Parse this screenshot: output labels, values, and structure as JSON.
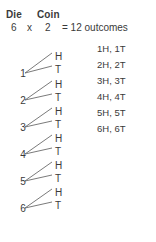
{
  "header": {
    "die_label": "Die",
    "coin_label": "Coin",
    "die_count": "6",
    "times_sign": "x",
    "coin_count": "2",
    "result_text": "= 12 outcomes"
  },
  "colors": {
    "text": "#3a3a3a",
    "line": "#6b6b6b",
    "background": "#ffffff"
  },
  "tree": {
    "die_nodes": [
      {
        "label": "1",
        "x": 18,
        "y": 68
      },
      {
        "label": "2",
        "x": 18,
        "y": 95
      },
      {
        "label": "3",
        "x": 18,
        "y": 122
      },
      {
        "label": "4",
        "x": 18,
        "y": 149
      },
      {
        "label": "5",
        "x": 18,
        "y": 176
      },
      {
        "label": "6",
        "x": 18,
        "y": 203
      }
    ],
    "coin_leaves": [
      {
        "label": "H",
        "x": 55,
        "y": 51
      },
      {
        "label": "T",
        "x": 55,
        "y": 64
      },
      {
        "label": "H",
        "x": 55,
        "y": 79
      },
      {
        "label": "T",
        "x": 55,
        "y": 92
      },
      {
        "label": "H",
        "x": 55,
        "y": 106
      },
      {
        "label": "T",
        "x": 55,
        "y": 119
      },
      {
        "label": "H",
        "x": 55,
        "y": 133
      },
      {
        "label": "T",
        "x": 55,
        "y": 146
      },
      {
        "label": "H",
        "x": 55,
        "y": 160
      },
      {
        "label": "T",
        "x": 55,
        "y": 173
      },
      {
        "label": "H",
        "x": 55,
        "y": 187
      },
      {
        "label": "T",
        "x": 55,
        "y": 200
      }
    ],
    "branches": [
      {
        "x1": 25,
        "y1": 73,
        "x2": 52,
        "y2": 53
      },
      {
        "x1": 25,
        "y1": 73,
        "x2": 52,
        "y2": 66
      },
      {
        "x1": 25,
        "y1": 100,
        "x2": 52,
        "y2": 81
      },
      {
        "x1": 25,
        "y1": 100,
        "x2": 52,
        "y2": 94
      },
      {
        "x1": 25,
        "y1": 127,
        "x2": 52,
        "y2": 108
      },
      {
        "x1": 25,
        "y1": 127,
        "x2": 52,
        "y2": 121
      },
      {
        "x1": 25,
        "y1": 154,
        "x2": 52,
        "y2": 135
      },
      {
        "x1": 25,
        "y1": 154,
        "x2": 52,
        "y2": 148
      },
      {
        "x1": 25,
        "y1": 181,
        "x2": 52,
        "y2": 162
      },
      {
        "x1": 25,
        "y1": 181,
        "x2": 52,
        "y2": 175
      },
      {
        "x1": 25,
        "y1": 208,
        "x2": 52,
        "y2": 189
      },
      {
        "x1": 25,
        "y1": 208,
        "x2": 52,
        "y2": 202
      }
    ]
  },
  "outcomes": {
    "x": 97,
    "items": [
      {
        "label": "1H, 1T",
        "y": 43
      },
      {
        "label": "2H, 2T",
        "y": 59
      },
      {
        "label": "3H, 3T",
        "y": 75
      },
      {
        "label": "4H, 4T",
        "y": 91
      },
      {
        "label": "5H, 5T",
        "y": 107
      },
      {
        "label": "6H, 6T",
        "y": 123
      }
    ]
  }
}
